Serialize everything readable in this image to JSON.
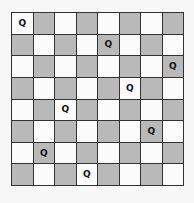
{
  "board": {
    "size": 8,
    "light_color": "#fbfbfb",
    "dark_color": "#b9b9b9",
    "piece_label": "Q",
    "queens": [
      {
        "row": 0,
        "col": 0
      },
      {
        "row": 1,
        "col": 4
      },
      {
        "row": 2,
        "col": 7
      },
      {
        "row": 3,
        "col": 5
      },
      {
        "row": 4,
        "col": 2
      },
      {
        "row": 5,
        "col": 6
      },
      {
        "row": 6,
        "col": 1
      },
      {
        "row": 7,
        "col": 3
      }
    ]
  }
}
